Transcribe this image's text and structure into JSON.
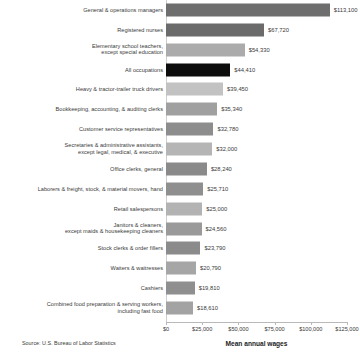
{
  "chart_data": {
    "type": "bar",
    "orientation": "horizontal",
    "title": "",
    "xlabel": "Mean annual wages",
    "ylabel": "",
    "xlim": [
      0,
      125000
    ],
    "grid": false,
    "legend": "none",
    "tick_labels": [
      "$0",
      "$25,000",
      "$50,000",
      "$75,000",
      "$100,000",
      "$125,000"
    ],
    "tick_values": [
      0,
      25000,
      50000,
      75000,
      100000,
      125000
    ],
    "source": "Source: U.S. Bureau of Labor Statistics",
    "categories": [
      "General & operations managers",
      "Registered nurses",
      "Elementary school teachers,\nexcept special education",
      "All occupations",
      "Heavy & tractor-trailer truck drivers",
      "Bookkeeping, accounting, & auditing clerks",
      "Customer service representatives",
      "Secretaries & administrative assistants,\nexcept legal, medical, & executive",
      "Office clerks, general",
      "Laborers & freight, stock, & material movers, hand",
      "Retail salespersons",
      "Janitors & cleaners,\nexcept maids & housekeeping cleaners",
      "Stock clerks & order fillers",
      "Waiters & waitresses",
      "Cashiers",
      "Combined food preparation & serving workers,\nincluding fast food"
    ],
    "values": [
      113100,
      67720,
      54330,
      44410,
      39450,
      35340,
      32780,
      32000,
      28240,
      25710,
      25000,
      24560,
      23790,
      20790,
      19810,
      18610
    ],
    "value_labels": [
      "$113,100",
      "$67,720",
      "$54,330",
      "$44,410",
      "$39,450",
      "$35,340",
      "$32,780",
      "$32,000",
      "$28,240",
      "$25,710",
      "$25,000",
      "$24,560",
      "$23,790",
      "$20,790",
      "$19,810",
      "$18,610"
    ],
    "bar_colors": [
      "#6e6e6e",
      "#6b6b6b",
      "#ababab",
      "#0d0d0d",
      "#c2c2c2",
      "#a0a0a0",
      "#8d8d8d",
      "#b5b5b5",
      "#8a8a8a",
      "#8f8f8f",
      "#b3b3b3",
      "#9a9a9a",
      "#8b8b8b",
      "#a6a6a6",
      "#8f8f8f",
      "#a3a3a3"
    ],
    "highlight_category": "All occupations",
    "highlight_color": "#0d0d0d"
  }
}
